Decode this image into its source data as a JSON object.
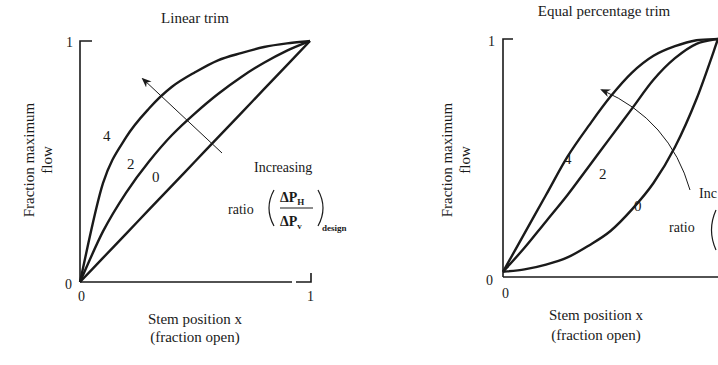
{
  "chart_data": [
    {
      "type": "line",
      "title": "Linear trim",
      "xlabel": "Stem position x",
      "xlabel_sub": "(fraction open)",
      "ylabel": "Fraction maximum",
      "ylabel_sub": "flow",
      "xlim": [
        0,
        1
      ],
      "ylim": [
        0,
        1
      ],
      "x_ticks": [
        "0",
        "1"
      ],
      "y_ticks": [
        "0",
        "1"
      ],
      "grid": false,
      "annotation": {
        "text_line1": "Increasing",
        "text_ratio": "ratio",
        "numerator": "ΔP",
        "numerator_sub": "H",
        "denominator": "ΔP",
        "denominator_sub": "v",
        "subscript": "design",
        "arrow": "points toward increasing ratio (from curve 0 toward curve 4)"
      },
      "x": [
        0,
        0.1,
        0.2,
        0.3,
        0.4,
        0.5,
        0.6,
        0.7,
        0.8,
        0.9,
        1.0
      ],
      "series": [
        {
          "name": "0",
          "values": [
            0,
            0.1,
            0.2,
            0.3,
            0.4,
            0.5,
            0.6,
            0.7,
            0.8,
            0.9,
            1.0
          ]
        },
        {
          "name": "2",
          "values": [
            0,
            0.21,
            0.37,
            0.5,
            0.61,
            0.7,
            0.78,
            0.85,
            0.91,
            0.96,
            1.0
          ]
        },
        {
          "name": "4",
          "values": [
            0,
            0.41,
            0.6,
            0.72,
            0.81,
            0.87,
            0.92,
            0.95,
            0.975,
            0.99,
            1.0
          ]
        }
      ]
    },
    {
      "type": "line",
      "title": "Equal percentage trim",
      "xlabel": "Stem position x",
      "xlabel_sub": "(fraction open)",
      "ylabel": "Fraction maximum",
      "ylabel_sub": "flow",
      "xlim": [
        0,
        1
      ],
      "ylim": [
        0,
        1
      ],
      "x_ticks": [
        "0"
      ],
      "y_ticks": [
        "0",
        "1"
      ],
      "grid": false,
      "annotation": {
        "text_line1": "Inc",
        "text_ratio": "ratio",
        "arrow": "points toward increasing ratio (from curve 0 toward curve 4)"
      },
      "x": [
        0,
        0.1,
        0.2,
        0.3,
        0.4,
        0.5,
        0.6,
        0.7,
        0.8,
        0.9,
        1.0
      ],
      "series": [
        {
          "name": "0",
          "values": [
            0.03,
            0.04,
            0.06,
            0.09,
            0.14,
            0.2,
            0.29,
            0.4,
            0.55,
            0.75,
            1.0
          ]
        },
        {
          "name": "2",
          "values": [
            0.03,
            0.13,
            0.24,
            0.35,
            0.47,
            0.59,
            0.71,
            0.83,
            0.92,
            0.98,
            1.0
          ]
        },
        {
          "name": "4",
          "values": [
            0.03,
            0.19,
            0.35,
            0.51,
            0.64,
            0.76,
            0.86,
            0.93,
            0.97,
            0.995,
            1.0
          ]
        }
      ]
    }
  ]
}
